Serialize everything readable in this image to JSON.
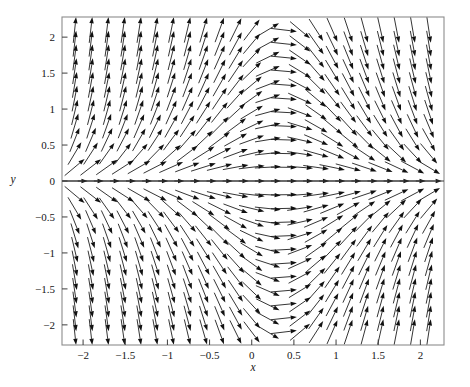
{
  "chart_data": {
    "type": "scatter",
    "plot_kind": "direction-field",
    "title": "",
    "subtitle": "",
    "xlabel": "x",
    "ylabel": "y",
    "xlim": [
      -2.25,
      2.28
    ],
    "ylim": [
      -2.28,
      2.28
    ],
    "xticks": [
      -2,
      -1.5,
      -1,
      -0.5,
      0,
      0.5,
      1,
      1.5,
      2
    ],
    "xtick_labels": [
      "-2",
      "-1.5",
      "-1",
      "-0.5",
      "0",
      "0.5",
      "1",
      "1.5",
      "2"
    ],
    "yticks": [
      2,
      1.5,
      1,
      0.5,
      0,
      -0.5,
      -1,
      -1.5,
      -2
    ],
    "ytick_labels": [
      "2",
      "1.5",
      "1",
      "0.5",
      "0",
      "-0.5",
      "-1",
      "-1.5",
      "-2"
    ],
    "grid": false,
    "legend": null,
    "legend_position": "none",
    "annotations": [],
    "axis_line_color": "#3c3c3c",
    "frame_color": "#8c8c8c",
    "arrow_color": "#111111",
    "background_color": "#ffffff",
    "field": {
      "description": "Planar direction field of arrows on a regular grid; horizontal flow to the right everywhere, vertical component repelling from the x-axis for x less than about 0.35 and attracting toward the x-axis for larger x. Arrows on the line y = 0 are exactly horizontal pointing right.",
      "grid_columns": 23,
      "grid_rows": 23,
      "x_start": -2.1,
      "x_end": 2.1,
      "y_start": -2.1,
      "y_end": 2.1,
      "u_expression": "1",
      "v_expression": "y*(0.35 - x)*2.1",
      "arrow_length_px": 26,
      "equilibrium_line": "y = 0",
      "separatrix_x": 0.35
    }
  },
  "axes": {
    "x_axis_label": "x",
    "y_axis_label": "y"
  }
}
